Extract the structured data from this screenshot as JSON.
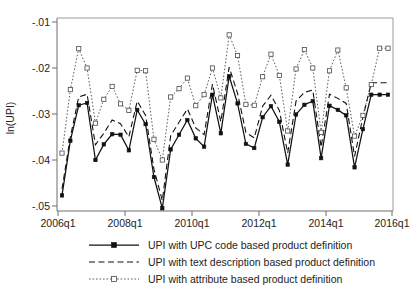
{
  "chart_data": {
    "type": "line",
    "title": "",
    "subtitle": "",
    "xlabel": "",
    "ylabel": "ln(UPI)",
    "grid": false,
    "legend_position": "bottom",
    "ylim": [
      -0.052,
      -0.0085
    ],
    "yticks": [
      -0.01,
      -0.02,
      -0.03,
      -0.04,
      -0.05
    ],
    "ytick_labels": [
      "-.01",
      "-.02",
      "-.03",
      "-.04",
      "-.05"
    ],
    "xticks": [
      "2006q1",
      "2008q1",
      "2010q1",
      "2012q1",
      "2014q1",
      "2016q1"
    ],
    "xtick_labels": [
      "2006q1",
      "2008q1",
      "2010q1",
      "2012q1",
      "2014q1",
      "2016q1"
    ],
    "x": [
      "2006q1",
      "2006q2",
      "2006q3",
      "2006q4",
      "2007q1",
      "2007q2",
      "2007q3",
      "2007q4",
      "2008q1",
      "2008q2",
      "2008q3",
      "2008q4",
      "2009q1",
      "2009q2",
      "2009q3",
      "2009q4",
      "2010q1",
      "2010q2",
      "2010q3",
      "2010q4",
      "2011q1",
      "2011q2",
      "2011q3",
      "2011q4",
      "2012q1",
      "2012q2",
      "2012q3",
      "2012q4",
      "2013q1",
      "2013q2",
      "2013q3",
      "2013q4",
      "2014q1",
      "2014q2",
      "2014q3",
      "2014q4",
      "2015q1",
      "2015q2",
      "2015q3",
      "2015q4"
    ],
    "series": [
      {
        "name": "UPI with UPC code based product definition",
        "style": "solid",
        "marker": "filled-square",
        "values": [
          -0.0477,
          -0.0358,
          -0.0281,
          -0.0276,
          -0.04,
          -0.0366,
          -0.0344,
          -0.0345,
          -0.0379,
          -0.0291,
          -0.0322,
          -0.0437,
          -0.0505,
          -0.0377,
          -0.0345,
          -0.0313,
          -0.0353,
          -0.0371,
          -0.0258,
          -0.0342,
          -0.0218,
          -0.0277,
          -0.0365,
          -0.0374,
          -0.0307,
          -0.0283,
          -0.0317,
          -0.041,
          -0.0301,
          -0.028,
          -0.0272,
          -0.0396,
          -0.0282,
          -0.0291,
          -0.0303,
          -0.0416,
          -0.0333,
          -0.0258,
          -0.0258,
          -0.0258
        ]
      },
      {
        "name": "UPI with text description based product definition",
        "style": "dashed",
        "marker": "none",
        "values": [
          -0.0463,
          -0.035,
          -0.0263,
          -0.0257,
          -0.0367,
          -0.0342,
          -0.0313,
          -0.0321,
          -0.035,
          -0.0272,
          -0.0303,
          -0.042,
          -0.0488,
          -0.0347,
          -0.0318,
          -0.0289,
          -0.033,
          -0.0345,
          -0.0235,
          -0.0317,
          -0.0198,
          -0.0255,
          -0.034,
          -0.0352,
          -0.0283,
          -0.0259,
          -0.0292,
          -0.0385,
          -0.0272,
          -0.0253,
          -0.0248,
          -0.0372,
          -0.0257,
          -0.0266,
          -0.0277,
          -0.0392,
          -0.0307,
          -0.0232,
          -0.0232,
          -0.0232
        ]
      },
      {
        "name": "UPI with attribute based product definition",
        "style": "dotted",
        "marker": "open-square",
        "values": [
          -0.0385,
          -0.0247,
          -0.0158,
          -0.02,
          -0.032,
          -0.0268,
          -0.024,
          -0.0278,
          -0.0292,
          -0.0205,
          -0.0206,
          -0.0355,
          -0.04,
          -0.0263,
          -0.0245,
          -0.0222,
          -0.0282,
          -0.0258,
          -0.02,
          -0.0265,
          -0.0128,
          -0.0173,
          -0.0279,
          -0.0281,
          -0.0219,
          -0.017,
          -0.0216,
          -0.0337,
          -0.0202,
          -0.016,
          -0.02,
          -0.034,
          -0.0206,
          -0.0161,
          -0.0243,
          -0.0348,
          -0.0303,
          -0.0236,
          -0.0157,
          -0.0157
        ]
      }
    ]
  },
  "axes": {
    "y_axis_title": "ln(UPI)"
  },
  "legend": {
    "entries": [
      {
        "label": "UPI with UPC code based product definition",
        "swatch": "solid-line-filled-square"
      },
      {
        "label": "UPI with text description based product definition",
        "swatch": "dashed-line"
      },
      {
        "label": "UPI with attribute based product definition",
        "swatch": "dotted-line-open-square"
      }
    ]
  },
  "colors": {
    "series_solid": "#111111",
    "series_dashed": "#111111",
    "series_dotted": "#555555",
    "axis": "#6f6f6f",
    "frame": "#9a9a9a",
    "background": "#ffffff",
    "text": "#232323"
  }
}
